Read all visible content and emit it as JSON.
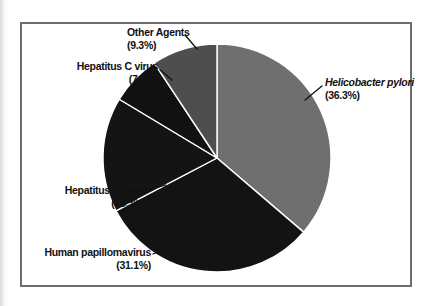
{
  "figure": {
    "background_color": "#ffffff",
    "frame_border_color": "#6e6e6e",
    "divider_color": "#ffffff",
    "label_color": "#111111"
  },
  "chart_data": {
    "type": "pie",
    "title": "",
    "legend": "none",
    "direction": "clockwise",
    "start_angle_deg": 0,
    "divider_color": "#ffffff",
    "slices": [
      {
        "label": "Helicobacter pylori",
        "value": 36.3,
        "pct_label": "(36.3%)",
        "color": "#6f6f6f",
        "italic": true
      },
      {
        "label": "Human papillomavirus",
        "value": 31.1,
        "pct_label": "(31.1%)",
        "color": "#131313",
        "italic": false
      },
      {
        "label": "Hepatitus B virus",
        "value": 16.3,
        "pct_label": "(16.3%)",
        "color": "#141414",
        "italic": false
      },
      {
        "label": "Hepatitus C virus",
        "value": 7.1,
        "pct_label": "(7.1%)",
        "color": "#111111",
        "italic": false
      },
      {
        "label": "Other Agents",
        "value": 9.3,
        "pct_label": "(9.3%)",
        "color": "#4e4e4e",
        "italic": false
      }
    ]
  }
}
